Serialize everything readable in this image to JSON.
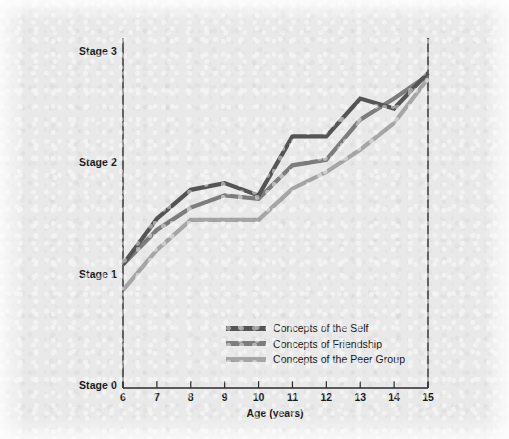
{
  "chart_data": {
    "type": "line",
    "title": "",
    "xlabel": "Age (years)",
    "ylabel": "",
    "x": [
      6,
      7,
      8,
      9,
      10,
      11,
      12,
      13,
      14,
      15
    ],
    "xticklabels": [
      "6",
      "7",
      "8",
      "9",
      "10",
      "11",
      "12",
      "13",
      "14",
      "15"
    ],
    "xlim": [
      6,
      15
    ],
    "ylim": [
      0,
      3
    ],
    "yticks": [
      0,
      1,
      2,
      3
    ],
    "yticklabels": [
      "Stage 0",
      "Stage 1",
      "Stage 2",
      "Stage 3"
    ],
    "grid": false,
    "legend_position": "inside-lower-center",
    "series": [
      {
        "name": "Concepts of the Self",
        "color": "#555555",
        "values": [
          1.11,
          1.52,
          1.78,
          1.84,
          1.73,
          2.26,
          2.26,
          2.6,
          2.51,
          2.83
        ]
      },
      {
        "name": "Concepts of Friendship",
        "color": "#7d7d7d",
        "values": [
          1.11,
          1.42,
          1.62,
          1.73,
          1.7,
          2.0,
          2.05,
          2.41,
          2.6,
          2.81
        ]
      },
      {
        "name": "Concepts of the Peer Group",
        "color": "#a6a6a6",
        "values": [
          0.88,
          1.24,
          1.51,
          1.51,
          1.51,
          1.79,
          1.94,
          2.14,
          2.38,
          2.78
        ]
      }
    ]
  },
  "axes": {
    "y_tick_labels": [
      "Stage 3",
      "Stage 2",
      "Stage 1",
      "Stage 0"
    ],
    "x_tick_labels": [
      "6",
      "7",
      "8",
      "9",
      "10",
      "11",
      "12",
      "13",
      "14",
      "15"
    ],
    "x_axis_title": "Age (years)",
    "axis_color": "#2a2a2a",
    "background_color": "#e9e9e9"
  },
  "legend": {
    "items": [
      {
        "label": "Concepts of the Self",
        "color": "#555555"
      },
      {
        "label": "Concepts of Friendship",
        "color": "#7d7d7d"
      },
      {
        "label": "Concepts of the Peer Group",
        "color": "#a6a6a6"
      }
    ]
  }
}
